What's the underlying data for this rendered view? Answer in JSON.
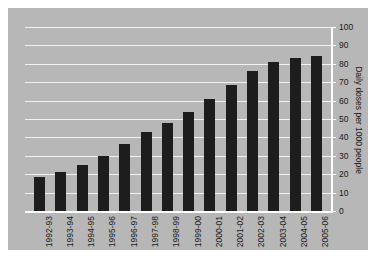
{
  "chart_data": {
    "type": "bar",
    "title": "",
    "xlabel": "",
    "ylabel": "Daily doses per 1000 people",
    "ylim": [
      0,
      100
    ],
    "ytick_step": 10,
    "yticks": [
      "0",
      "10",
      "20",
      "30",
      "40",
      "50",
      "60",
      "70",
      "80",
      "90",
      "100"
    ],
    "grid": true,
    "legend": "none",
    "bar_color": "#1d1d1d",
    "panel_color": "#b7b7b7",
    "gridline_color": "#f2f2f2",
    "axis_color": "#ffffff",
    "categories": [
      "1992-93",
      "1993-94",
      "1994-95",
      "1995-96",
      "1996-97",
      "1997-98",
      "1998-99",
      "1999-00",
      "2000-01",
      "2001-02",
      "2002-03",
      "2003-04",
      "2004-05",
      "2005-06"
    ],
    "values": [
      18.5,
      21,
      25,
      30,
      36.5,
      43,
      48,
      54,
      61,
      68.5,
      76,
      81,
      83,
      84.5
    ]
  }
}
